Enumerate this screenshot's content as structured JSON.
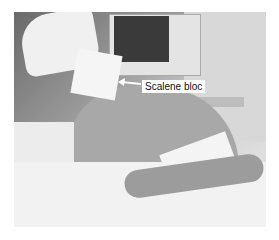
{
  "figure": {
    "type": "photograph",
    "annotation": {
      "label": "Scalene bloc",
      "pointer": "arrow-left"
    }
  }
}
